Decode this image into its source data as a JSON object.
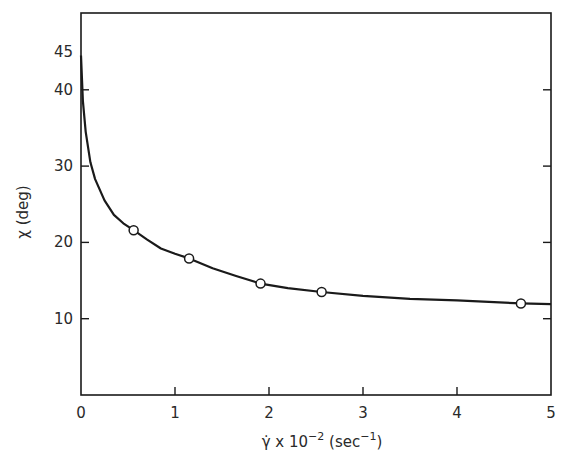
{
  "chart_data": {
    "type": "line",
    "title": "",
    "xlabel": "γ̇ x 10⁻² (sec⁻¹)",
    "xlabel_parts": {
      "base": "γ̇ x 10",
      "exp": "−2",
      "unit": "(sec",
      "unit_exp": "−1",
      "close": ")"
    },
    "ylabel": "χ (deg)",
    "xlim": [
      0,
      5
    ],
    "ylim": [
      0,
      50
    ],
    "x_ticks": [
      0,
      1,
      2,
      3,
      4,
      5
    ],
    "x_tick_labels": [
      "0",
      "1",
      "2",
      "3",
      "4",
      "5"
    ],
    "y_ticks": [
      10,
      20,
      30,
      40
    ],
    "y_tick_labels": [
      "10",
      "20",
      "30",
      "40"
    ],
    "y_extra_label": {
      "value": 45,
      "text": "45"
    },
    "grid": false,
    "legend": null,
    "series": [
      {
        "name": "measured",
        "style": "open-circle markers",
        "x": [
          0.56,
          1.15,
          1.91,
          2.56,
          4.68
        ],
        "y": [
          21.6,
          17.9,
          14.6,
          13.5,
          12.0
        ]
      },
      {
        "name": "fitted curve",
        "style": "solid line",
        "x": [
          0.0,
          0.02,
          0.05,
          0.1,
          0.15,
          0.25,
          0.35,
          0.45,
          0.56,
          0.7,
          0.85,
          1.0,
          1.15,
          1.4,
          1.65,
          1.91,
          2.2,
          2.56,
          3.0,
          3.5,
          4.0,
          4.68,
          5.0
        ],
        "y": [
          44.5,
          38.5,
          34.5,
          30.5,
          28.3,
          25.5,
          23.6,
          22.5,
          21.6,
          20.4,
          19.2,
          18.5,
          17.9,
          16.6,
          15.6,
          14.6,
          14.0,
          13.5,
          13.0,
          12.6,
          12.4,
          12.0,
          11.9
        ]
      }
    ]
  }
}
